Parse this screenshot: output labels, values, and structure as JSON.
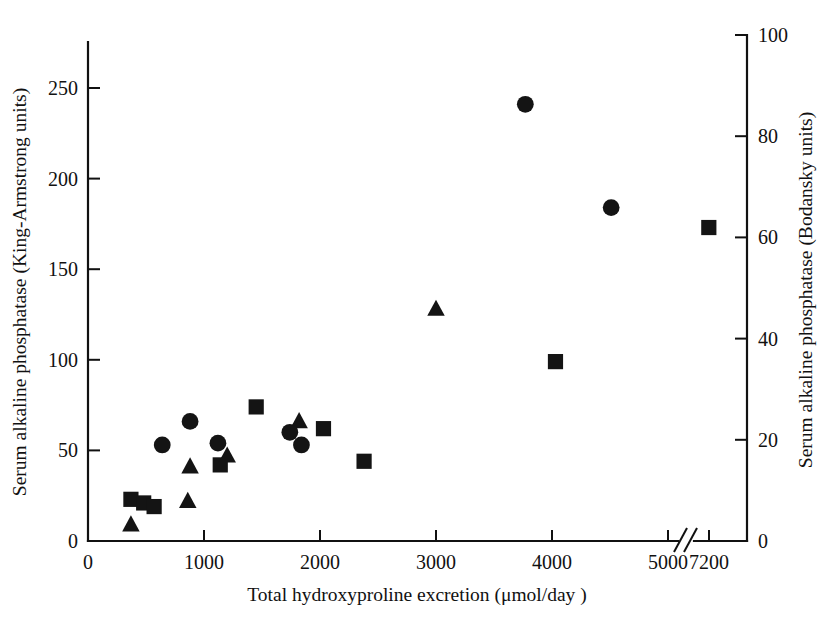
{
  "chart_data": {
    "type": "scatter",
    "title": "",
    "xlabel": "Total hydroxyproline excretion (μmol/day )",
    "ylabel": "Serum alkaline phosphatase (King-Armstrong units)",
    "ylabel_right": "Serum alkaline phosphatase (Bodansky units)",
    "xlim": [
      0,
      7200
    ],
    "ylim": [
      0,
      276
    ],
    "ylim_right": [
      0,
      100
    ],
    "grid": false,
    "legend": "none",
    "axis_break": {
      "present": true,
      "between": [
        5000,
        7200
      ],
      "symbol": "//"
    },
    "xticks": [
      {
        "value": 0,
        "label": "0"
      },
      {
        "value": 1000,
        "label": "1000"
      },
      {
        "value": 2000,
        "label": "2000"
      },
      {
        "value": 3000,
        "label": "3000"
      },
      {
        "value": 4000,
        "label": "4000"
      },
      {
        "value": 5000,
        "label": "5000"
      },
      {
        "value": 7200,
        "label": "7200"
      }
    ],
    "yticks_left": [
      {
        "value": 0,
        "label": "0"
      },
      {
        "value": 50,
        "label": "50"
      },
      {
        "value": 100,
        "label": "100"
      },
      {
        "value": 150,
        "label": "150"
      },
      {
        "value": 200,
        "label": "200"
      },
      {
        "value": 250,
        "label": "250"
      }
    ],
    "yticks_right": [
      {
        "value": 0,
        "label": "0"
      },
      {
        "value": 20,
        "label": "20"
      },
      {
        "value": 40,
        "label": "40"
      },
      {
        "value": 60,
        "label": "60"
      },
      {
        "value": 80,
        "label": "80"
      },
      {
        "value": 100,
        "label": "100"
      }
    ],
    "series": [
      {
        "name": "circle",
        "marker": "circle",
        "color": "#141414",
        "points": [
          {
            "x": 640,
            "y": 53
          },
          {
            "x": 880,
            "y": 66
          },
          {
            "x": 1120,
            "y": 54
          },
          {
            "x": 1740,
            "y": 60
          },
          {
            "x": 1840,
            "y": 53
          },
          {
            "x": 3770,
            "y": 241
          },
          {
            "x": 4510,
            "y": 184
          }
        ]
      },
      {
        "name": "square",
        "marker": "square",
        "color": "#141414",
        "points": [
          {
            "x": 370,
            "y": 23
          },
          {
            "x": 480,
            "y": 21
          },
          {
            "x": 570,
            "y": 19
          },
          {
            "x": 1140,
            "y": 42
          },
          {
            "x": 1450,
            "y": 74
          },
          {
            "x": 2030,
            "y": 62
          },
          {
            "x": 2380,
            "y": 44
          },
          {
            "x": 4030,
            "y": 99
          },
          {
            "x": 7190,
            "y": 173
          }
        ]
      },
      {
        "name": "triangle",
        "marker": "triangle",
        "color": "#141414",
        "points": [
          {
            "x": 370,
            "y": 9
          },
          {
            "x": 860,
            "y": 22
          },
          {
            "x": 880,
            "y": 41
          },
          {
            "x": 1200,
            "y": 47
          },
          {
            "x": 1820,
            "y": 66
          },
          {
            "x": 3000,
            "y": 128
          }
        ]
      }
    ]
  }
}
